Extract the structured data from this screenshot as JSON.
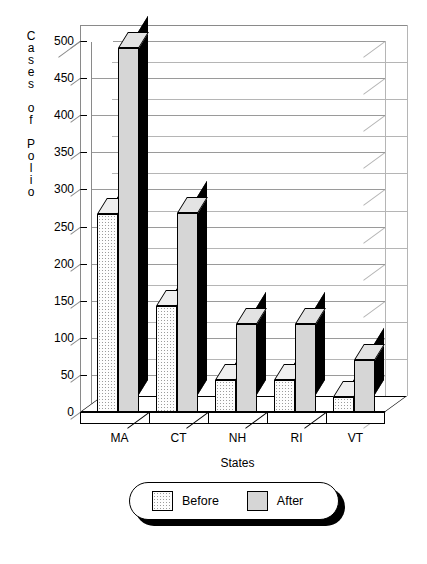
{
  "chart_data": {
    "type": "bar",
    "title": "",
    "xlabel": "States",
    "ylabel": "Cases of Polio",
    "categories": [
      "MA",
      "CT",
      "NH",
      "RI",
      "VT"
    ],
    "series": [
      {
        "name": "Before",
        "values": [
          267,
          143,
          43,
          43,
          20
        ]
      },
      {
        "name": "After",
        "values": [
          490,
          268,
          119,
          119,
          70
        ]
      }
    ],
    "ylim": [
      0,
      500
    ],
    "ytick_step": 50,
    "yticks": [
      "500",
      "450",
      "400",
      "350",
      "300",
      "250",
      "200",
      "150",
      "100",
      "50",
      "0"
    ],
    "grid": true,
    "legend_position": "bottom",
    "style": "3d-column",
    "colors": {
      "before_fill": "#fdfdfd",
      "after_fill": "#d6d6d6",
      "bar_side": "#000000",
      "grid": "#9a9a9a",
      "axis": "#000000"
    }
  },
  "axis": {
    "y_title_chars": [
      "C",
      "a",
      "s",
      "e",
      "s",
      "",
      "o",
      "f",
      "",
      "P",
      "o",
      "l",
      "i",
      "o"
    ],
    "x_title": "States"
  },
  "legend": {
    "items": [
      {
        "label": "Before",
        "swatch": "before-swatch"
      },
      {
        "label": "After",
        "swatch": "after-swatch"
      }
    ]
  }
}
